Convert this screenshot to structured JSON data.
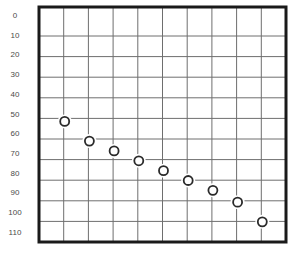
{
  "chart_data": {
    "type": "scatter",
    "title": "",
    "xlabel": "",
    "ylabel": "",
    "y_ticks": [
      "0",
      "10",
      "20",
      "30",
      "40",
      "50",
      "60",
      "70",
      "80",
      "90",
      "100",
      "110"
    ],
    "x_ticks": [],
    "ylim": [
      0,
      110
    ],
    "y_axis_inverted": true,
    "grid": true,
    "grid_columns": 10,
    "grid_rows": 11,
    "legend": null,
    "marker": "open-circle",
    "points": [
      {
        "x": 1,
        "y": 54
      },
      {
        "x": 2,
        "y": 64
      },
      {
        "x": 3,
        "y": 69
      },
      {
        "x": 4,
        "y": 74
      },
      {
        "x": 5,
        "y": 79
      },
      {
        "x": 6,
        "y": 84
      },
      {
        "x": 7,
        "y": 89
      },
      {
        "x": 8,
        "y": 95
      },
      {
        "x": 9,
        "y": 105
      }
    ]
  },
  "style": {
    "border_color": "#1a1a1a",
    "grid_color": "#6e6e6e",
    "label_color": "#4a4a4a",
    "marker_stroke": "#2a2a2a"
  }
}
